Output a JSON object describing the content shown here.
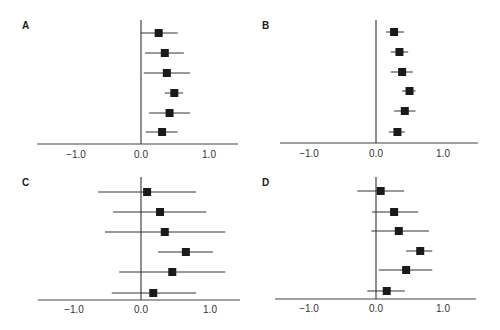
{
  "figure": {
    "panels": [
      {
        "id": "A",
        "label": "A"
      },
      {
        "id": "B",
        "label": "B"
      },
      {
        "id": "C",
        "label": "C"
      },
      {
        "id": "D",
        "label": "D"
      }
    ],
    "tick_labels": [
      "−1.0",
      "0.0",
      "1.0"
    ]
  },
  "colors": {
    "marker": "#1a1a1a",
    "line": "#333333",
    "axis": "#444444"
  },
  "chart_data": [
    {
      "type": "forest",
      "title": "A",
      "xlabel": "",
      "ylabel": "",
      "xticks": [
        -1.0,
        0.0,
        1.0
      ],
      "xtick_labels": [
        "−1.0",
        "0.0",
        "1.0"
      ],
      "xlim": [
        -1.55,
        1.45
      ],
      "reference_line": 0.0,
      "grid": false,
      "rows": [
        {
          "estimate": 0.26,
          "lower": 0.0,
          "upper": 0.54
        },
        {
          "estimate": 0.35,
          "lower": 0.06,
          "upper": 0.63
        },
        {
          "estimate": 0.38,
          "lower": 0.04,
          "upper": 0.72
        },
        {
          "estimate": 0.49,
          "lower": 0.35,
          "upper": 0.62
        },
        {
          "estimate": 0.42,
          "lower": 0.12,
          "upper": 0.72
        },
        {
          "estimate": 0.31,
          "lower": 0.07,
          "upper": 0.54
        }
      ]
    },
    {
      "type": "forest",
      "title": "B",
      "xlabel": "",
      "ylabel": "",
      "xticks": [
        -1.0,
        0.0,
        1.0
      ],
      "xtick_labels": [
        "−1.0",
        "0.0",
        "1.0"
      ],
      "xlim": [
        -1.45,
        1.5
      ],
      "reference_line": 0.0,
      "grid": false,
      "rows": [
        {
          "estimate": 0.27,
          "lower": 0.15,
          "upper": 0.42
        },
        {
          "estimate": 0.35,
          "lower": 0.22,
          "upper": 0.48
        },
        {
          "estimate": 0.39,
          "lower": 0.22,
          "upper": 0.55
        },
        {
          "estimate": 0.5,
          "lower": 0.39,
          "upper": 0.59
        },
        {
          "estimate": 0.43,
          "lower": 0.27,
          "upper": 0.59
        },
        {
          "estimate": 0.32,
          "lower": 0.19,
          "upper": 0.43
        }
      ]
    },
    {
      "type": "forest",
      "title": "C",
      "xlabel": "",
      "ylabel": "",
      "xticks": [
        -1.0,
        0.0,
        1.0
      ],
      "xtick_labels": [
        "−1.0",
        "0.0",
        "1.0"
      ],
      "xlim": [
        -1.53,
        1.45
      ],
      "reference_line": 0.0,
      "grid": false,
      "rows": [
        {
          "estimate": 0.09,
          "lower": -0.63,
          "upper": 0.81
        },
        {
          "estimate": 0.28,
          "lower": -0.41,
          "upper": 0.96
        },
        {
          "estimate": 0.35,
          "lower": -0.53,
          "upper": 1.24
        },
        {
          "estimate": 0.66,
          "lower": 0.25,
          "upper": 1.06
        },
        {
          "estimate": 0.46,
          "lower": -0.32,
          "upper": 1.24
        },
        {
          "estimate": 0.18,
          "lower": -0.43,
          "upper": 0.81
        }
      ]
    },
    {
      "type": "forest",
      "title": "D",
      "xlabel": "",
      "ylabel": "",
      "xticks": [
        -1.0,
        0.0,
        1.0
      ],
      "xtick_labels": [
        "−1.0",
        "0.0",
        "1.0"
      ],
      "xlim": [
        -1.5,
        1.5
      ],
      "reference_line": 0.0,
      "grid": false,
      "rows": [
        {
          "estimate": 0.07,
          "lower": -0.28,
          "upper": 0.42
        },
        {
          "estimate": 0.27,
          "lower": -0.06,
          "upper": 0.63
        },
        {
          "estimate": 0.34,
          "lower": -0.07,
          "upper": 0.79
        },
        {
          "estimate": 0.66,
          "lower": 0.45,
          "upper": 0.84
        },
        {
          "estimate": 0.45,
          "lower": 0.04,
          "upper": 0.84
        },
        {
          "estimate": 0.16,
          "lower": -0.13,
          "upper": 0.43
        }
      ]
    }
  ]
}
